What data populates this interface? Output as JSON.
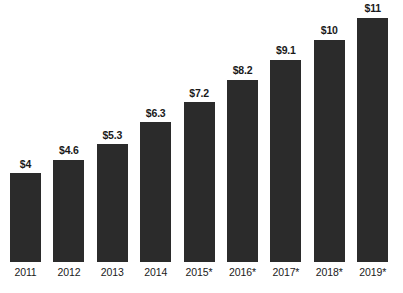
{
  "chart_data": {
    "type": "bar",
    "title": "",
    "subtitle": "",
    "xlabel": "",
    "ylabel": "",
    "grid": false,
    "legend": "none",
    "ylim": [
      0,
      11.8
    ],
    "categories": [
      "2011",
      "2012",
      "2013",
      "2014",
      "2015*",
      "2016*",
      "2017*",
      "2018*",
      "2019*"
    ],
    "values": [
      4,
      4.6,
      5.3,
      6.3,
      7.2,
      8.2,
      9.1,
      10,
      11
    ],
    "value_labels": [
      "$4",
      "$4.6",
      "$5.3",
      "$6.3",
      "$7.2",
      "$8.2",
      "$9.1",
      "$10",
      "$11"
    ],
    "series": [
      {
        "name": "",
        "values": [
          4,
          4.6,
          5.3,
          6.3,
          7.2,
          8.2,
          9.1,
          10,
          11
        ]
      }
    ],
    "bar_color": "#2b2b2b",
    "background_color": "#ffffff",
    "annotations": [
      "* denotes projected/estimated years"
    ]
  },
  "caption": {
    "footer_text": ""
  }
}
